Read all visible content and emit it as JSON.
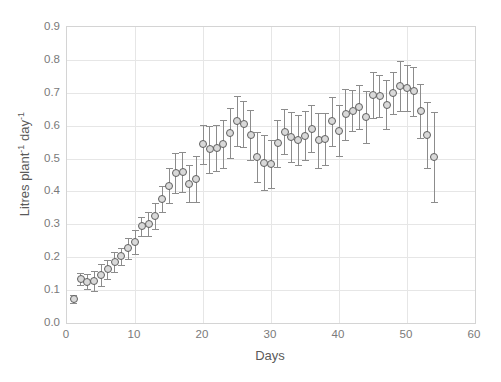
{
  "chart_data": {
    "type": "scatter",
    "title": "Evapotranspiration of cannabis (bloom)",
    "xlabel": "Days",
    "ylabel": "Litres plant-1 day-1",
    "ylabel_parts": {
      "base1": "Litres plant",
      "sup1": "-1",
      "base2": " day",
      "sup2": "-1"
    },
    "xlim": [
      0,
      60
    ],
    "ylim": [
      0.0,
      0.9
    ],
    "xticks": [
      0,
      10,
      20,
      30,
      40,
      50,
      60
    ],
    "yticks": [
      "0.0",
      "0.1",
      "0.2",
      "0.3",
      "0.4",
      "0.5",
      "0.6",
      "0.7",
      "0.8",
      "0.9"
    ],
    "grid": true,
    "legend": "none",
    "marker": "open-circle",
    "error_bars": "symmetric-vertical",
    "series_name": "Evapotranspiration",
    "x": [
      1,
      2,
      3,
      4,
      5,
      6,
      7,
      8,
      9,
      10,
      11,
      12,
      13,
      14,
      15,
      16,
      17,
      18,
      19,
      20,
      21,
      22,
      23,
      24,
      25,
      26,
      27,
      28,
      29,
      30,
      31,
      32,
      33,
      34,
      35,
      36,
      37,
      38,
      39,
      40,
      41,
      42,
      43,
      44,
      45,
      46,
      47,
      48,
      49,
      50,
      51,
      52,
      53,
      54
    ],
    "y": [
      0.072,
      0.133,
      0.126,
      0.127,
      0.146,
      0.164,
      0.186,
      0.203,
      0.227,
      0.246,
      0.294,
      0.301,
      0.325,
      0.376,
      0.417,
      0.457,
      0.459,
      0.424,
      0.437,
      0.543,
      0.528,
      0.531,
      0.544,
      0.578,
      0.614,
      0.604,
      0.573,
      0.505,
      0.488,
      0.483,
      0.546,
      0.582,
      0.565,
      0.557,
      0.57,
      0.591,
      0.555,
      0.559,
      0.613,
      0.585,
      0.634,
      0.646,
      0.657,
      0.627,
      0.693,
      0.691,
      0.664,
      0.699,
      0.721,
      0.714,
      0.704,
      0.644,
      0.571,
      0.505
    ],
    "yerr": [
      0.012,
      0.018,
      0.022,
      0.031,
      0.034,
      0.029,
      0.03,
      0.026,
      0.032,
      0.036,
      0.029,
      0.035,
      0.04,
      0.04,
      0.053,
      0.061,
      0.06,
      0.057,
      0.07,
      0.06,
      0.071,
      0.07,
      0.072,
      0.075,
      0.075,
      0.07,
      0.076,
      0.075,
      0.085,
      0.074,
      0.071,
      0.069,
      0.076,
      0.076,
      0.074,
      0.072,
      0.083,
      0.08,
      0.074,
      0.078,
      0.077,
      0.063,
      0.066,
      0.079,
      0.07,
      0.064,
      0.074,
      0.065,
      0.075,
      0.07,
      0.075,
      0.082,
      0.1,
      0.136
    ]
  },
  "colors": {
    "marker_fill": "#d9d9d9",
    "marker_stroke": "#5f5f5f",
    "error_bar": "#8c8c8c",
    "gridline": "#e6e6e6",
    "axis_frame": "#d4d4d4",
    "text": "#5a5a5a",
    "tick_text": "#7a7a7a",
    "background": "#ffffff"
  }
}
